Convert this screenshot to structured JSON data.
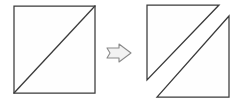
{
  "canvas": {
    "width": 246,
    "height": 103,
    "background": "#ffffff",
    "stroke_color": "#3a3a3a",
    "fill_color": "#fefefe",
    "arrow_stroke_color": "#8a8a8a",
    "arrow_fill_color": "#f2f2f2"
  },
  "diagram": {
    "title": "Square divided by a diagonal transformed into two separated triangles",
    "type": "geometric-transformation",
    "figures": [
      {
        "id": "source-square",
        "label": "square-with-diagonal",
        "description": "Square with a diagonal drawn from the bottom-left corner to the top-right corner",
        "bounds": {
          "x": 14,
          "y": 6,
          "width": 81,
          "height": 87
        },
        "outline_points": "14,6 95,6 95,93 14,93",
        "diagonal_points": "14,93 95,6"
      },
      {
        "id": "result-upper-triangle",
        "label": "upper-left-triangle",
        "description": "Upper-left triangle separated from the square and shifted up and left",
        "points": "147,5 219,5 147,80"
      },
      {
        "id": "result-lower-triangle",
        "label": "lower-right-triangle",
        "description": "Lower-right triangle separated from the square and shifted down and right",
        "points": "157,97 229,97 229,16"
      }
    ],
    "arrow": {
      "id": "transformation-arrow",
      "label": "double-line right arrow",
      "glyph_name": "right-arrow-outline",
      "direction": "right",
      "points": "107,48 119,48 119,44 131,53 119,62 119,58 107,58 110,53"
    }
  }
}
